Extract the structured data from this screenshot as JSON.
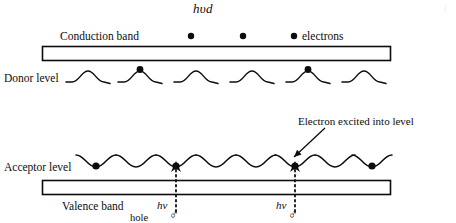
{
  "figure": {
    "title_formula": "hυd",
    "corner_artifact": "(",
    "width": 456,
    "height": 223,
    "background": "#ffffff",
    "ink_color": "#0d0d0d"
  },
  "conduction_band": {
    "label": "Conduction band",
    "electrons_label": "electrons",
    "rect": {
      "x": 42,
      "y": 46,
      "w": 348,
      "h": 14
    },
    "label_pos": {
      "x": 60,
      "y": 31
    },
    "electrons_label_pos": {
      "x": 302,
      "y": 31
    },
    "electron_dots": [
      {
        "x": 191,
        "y": 36,
        "r": 3.2
      },
      {
        "x": 243,
        "y": 36,
        "r": 3.2
      },
      {
        "x": 294,
        "y": 36,
        "r": 3.2
      }
    ]
  },
  "donor_level": {
    "label": "Donor level",
    "label_pos": {
      "x": 4,
      "y": 73
    },
    "baseline_y": 82,
    "bump_height": 11,
    "bump_half_width": 16,
    "bumps": [
      {
        "x": 88,
        "occupied": false
      },
      {
        "x": 140,
        "occupied": true
      },
      {
        "x": 196,
        "occupied": false
      },
      {
        "x": 252,
        "occupied": false
      },
      {
        "x": 308,
        "occupied": true
      },
      {
        "x": 364,
        "occupied": false
      }
    ],
    "dot_radius": 3.4
  },
  "annotation": {
    "text": "Electron excited into level",
    "text_pos": {
      "x": 298,
      "y": 116
    },
    "arrow": {
      "x1": 325,
      "y1": 128,
      "x2": 294,
      "y2": 157
    }
  },
  "acceptor_level": {
    "label": "Acceptor level",
    "label_pos": {
      "x": 4,
      "y": 162
    },
    "baseline_y": 157,
    "dip_depth": 10,
    "dip_half_width": 15,
    "dips": [
      {
        "x": 96,
        "occupied": true
      },
      {
        "x": 136,
        "occupied": false
      },
      {
        "x": 176,
        "occupied": true
      },
      {
        "x": 216,
        "occupied": false
      },
      {
        "x": 256,
        "occupied": false
      },
      {
        "x": 295,
        "occupied": true
      },
      {
        "x": 335,
        "occupied": false
      },
      {
        "x": 372,
        "occupied": true
      }
    ],
    "dot_radius": 3.6
  },
  "valence_band": {
    "label": "Valence band",
    "rect": {
      "x": 42,
      "y": 180,
      "w": 348,
      "h": 14
    },
    "label_pos": {
      "x": 62,
      "y": 201
    }
  },
  "transitions": [
    {
      "photon_label": "hν",
      "hole_symbol": "♂",
      "hole_word": "hole",
      "arrow_x": 176,
      "arrow_top_y": 161,
      "arrow_bottom_y": 212,
      "photon_label_pos": {
        "x": 157,
        "y": 200
      },
      "hole_symbol_pos": {
        "x": 169,
        "y": 208
      },
      "hole_word_pos": {
        "x": 130,
        "y": 213
      }
    },
    {
      "photon_label": "hν",
      "hole_symbol": "♂",
      "hole_word": "",
      "arrow_x": 295,
      "arrow_top_y": 161,
      "arrow_bottom_y": 212,
      "photon_label_pos": {
        "x": 276,
        "y": 200
      },
      "hole_symbol_pos": {
        "x": 288,
        "y": 208
      },
      "hole_word_pos": {
        "x": 0,
        "y": 0
      }
    }
  ]
}
